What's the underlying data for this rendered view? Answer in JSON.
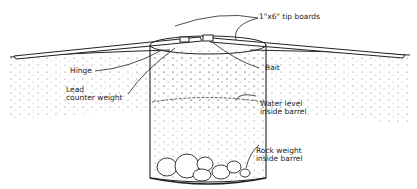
{
  "diagram": {
    "labels": {
      "tip_boards": "1\"x6\" tip boards",
      "hinge": "Hinge",
      "bait": "Bait",
      "lead_1": "Lead",
      "lead_2": "counter weight",
      "water_1": "Water level",
      "water_2": "inside barrel",
      "rock_1": "Rock weight",
      "rock_2": "inside barrel"
    },
    "colors": {
      "ink": "#222222",
      "background": "#ffffff"
    }
  }
}
